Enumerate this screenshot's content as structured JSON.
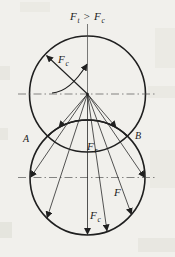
{
  "figure": {
    "title": {
      "f1": "F",
      "sub1": "t",
      "rel": ">",
      "f2": "F",
      "sub2": "c"
    },
    "labels": {
      "centrifugal": {
        "f": "F",
        "sub": "c"
      },
      "point_a": "A",
      "point_b": "B",
      "radial": {
        "f": "F",
        "sub": "r"
      },
      "force": "F",
      "resultant": {
        "f": "F",
        "sub": "c"
      }
    },
    "colors": {
      "shade": "#b3b3b3",
      "ink": "#222222",
      "paper": "#f1f0ec"
    }
  }
}
